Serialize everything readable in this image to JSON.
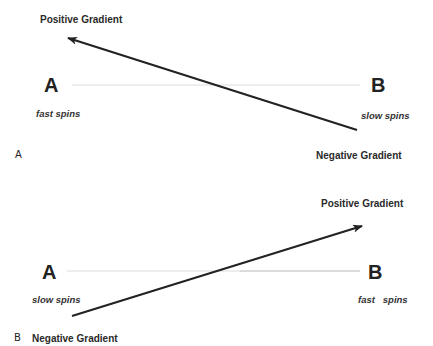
{
  "panel_a": {
    "label": "A",
    "top_heading": "Positive Gradient",
    "bottom_heading": "Negative Gradient",
    "left_node": "A",
    "left_caption": "fast spins",
    "right_node": "B",
    "right_caption": "slow spins",
    "arrow": {
      "from": [
        357,
        130
      ],
      "to": [
        68,
        38
      ],
      "color": "#222222"
    },
    "baseline": {
      "x1": 72,
      "x2": 360,
      "y": 85,
      "color": "#d8d8d8"
    }
  },
  "panel_b": {
    "label": "B",
    "top_heading": "Positive Gradient",
    "bottom_heading": "Negative Gradient",
    "left_node": "A",
    "left_caption": "slow spins",
    "right_node": "B",
    "right_caption": "fast   spins",
    "arrow": {
      "from": [
        72,
        316
      ],
      "to": [
        362,
        226
      ],
      "color": "#222222"
    },
    "baseline": {
      "x1": 67,
      "x2": 360,
      "y": 271,
      "color": "#d8d8d8"
    }
  }
}
